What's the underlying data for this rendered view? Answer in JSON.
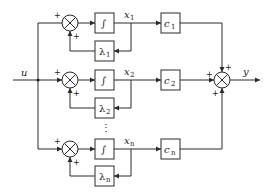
{
  "diagram": {
    "type": "block-diagram",
    "input": {
      "label": "u"
    },
    "output": {
      "label": "y"
    },
    "integrator_symbol": "∫",
    "branches": [
      {
        "state": "x",
        "state_sub": "1",
        "feedback": "λ",
        "feedback_sub": "1",
        "gain": "c",
        "gain_sub": "1",
        "input_sign": "+",
        "feedback_sign": "+",
        "output_sign": "+"
      },
      {
        "state": "x",
        "state_sub": "2",
        "feedback": "λ",
        "feedback_sub": "2",
        "gain": "c",
        "gain_sub": "2",
        "input_sign": "+",
        "feedback_sign": "+",
        "output_sign": "+"
      },
      {
        "state": "x",
        "state_sub": "n",
        "feedback": "λ",
        "feedback_sub": "n",
        "gain": "c",
        "gain_sub": "n",
        "input_sign": "+",
        "feedback_sign": "+",
        "output_sign": "+"
      }
    ],
    "ellipsis": "⋮"
  }
}
